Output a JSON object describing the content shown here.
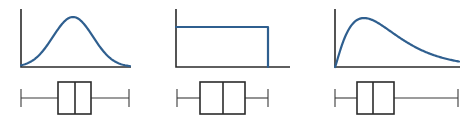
{
  "figure": {
    "colors": {
      "curve": "#2f5f8f",
      "axis": "#2b2b2b",
      "background": "#ffffff"
    },
    "panels": [
      {
        "name": "symmetric-bell",
        "shape": "bell",
        "axes": {
          "x0": 21,
          "x1": 131,
          "y_top": 9,
          "y_base": 67
        },
        "curve": {
          "peak_x": 73,
          "peak_y": 17,
          "end_x": 130
        },
        "boxplot": {
          "y_center": 98,
          "y_top": 82,
          "y_bottom": 114,
          "whisker_left": 21,
          "q1": 58,
          "median": 75,
          "q3": 91,
          "whisker_right": 129
        }
      },
      {
        "name": "uniform",
        "shape": "uniform",
        "axes": {
          "x0": 176,
          "x1": 290,
          "y_top": 9,
          "y_base": 67
        },
        "curve": {
          "top_y": 27,
          "right_x": 268
        },
        "boxplot": {
          "y_center": 98,
          "y_top": 82,
          "y_bottom": 114,
          "whisker_left": 177,
          "q1": 200,
          "median": 223,
          "q3": 245,
          "whisker_right": 268
        }
      },
      {
        "name": "right-skewed",
        "shape": "skewed",
        "axes": {
          "x0": 335,
          "x1": 460,
          "y_top": 9,
          "y_base": 67
        },
        "curve": {
          "peak_x": 364,
          "peak_y": 18,
          "end_x": 459
        },
        "boxplot": {
          "y_center": 98,
          "y_top": 82,
          "y_bottom": 114,
          "whisker_left": 335,
          "q1": 357,
          "median": 373,
          "q3": 394,
          "whisker_right": 458
        }
      }
    ]
  }
}
